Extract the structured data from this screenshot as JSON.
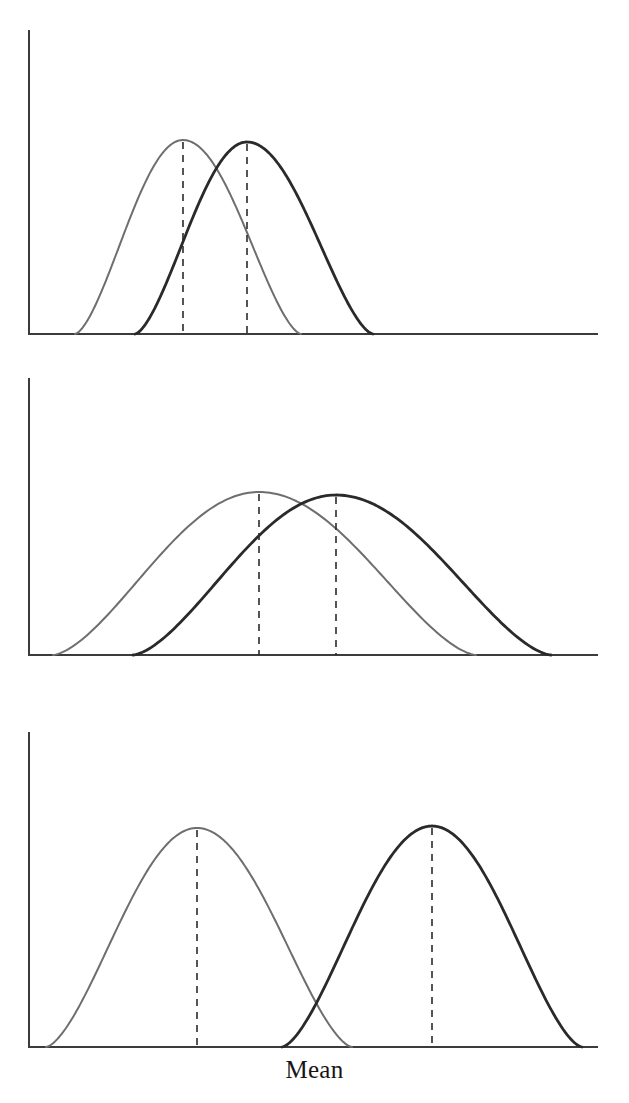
{
  "figure": {
    "width": 629,
    "height": 1103,
    "background": "#ffffff",
    "x_axis_caption": "Mean",
    "caption_y": 1057,
    "caption_font_size": 25
  },
  "style": {
    "axis_color": "#3b3b3b",
    "axis_width": 2,
    "dash_color": "#2b2b2b",
    "dash_width": 1.6,
    "dash_pattern": "7 6",
    "light_curve_color": "#6e6e6e",
    "light_curve_width": 2.0,
    "dark_curve_color": "#2a2a2a",
    "dark_curve_width": 2.8
  },
  "chart_data": {
    "type": "line",
    "title": "",
    "subtitle": "",
    "xlabel": "Mean",
    "ylabel": "",
    "grid": false,
    "legend": "none",
    "panels": [
      {
        "name": "panel-top",
        "index": 1,
        "plot": {
          "x0": 29,
          "x1": 597,
          "baseline_y": 334,
          "axis_top_y": 31
        },
        "series": [
          {
            "name": "group-light-top",
            "style": "light",
            "mean_x": 183,
            "peak_y": 140,
            "left_x": 75,
            "right_x": 301
          },
          {
            "name": "group-dark-top",
            "style": "dark",
            "mean_x": 247,
            "peak_y": 142,
            "left_x": 135,
            "right_x": 373
          }
        ]
      },
      {
        "name": "panel-middle",
        "index": 2,
        "plot": {
          "x0": 29,
          "x1": 597,
          "baseline_y": 655,
          "axis_top_y": 379
        },
        "series": [
          {
            "name": "group-light-middle",
            "style": "light",
            "mean_x": 259,
            "peak_y": 492,
            "left_x": 53,
            "right_x": 476
          },
          {
            "name": "group-dark-middle",
            "style": "dark",
            "mean_x": 336,
            "peak_y": 495,
            "left_x": 133,
            "right_x": 551
          }
        ]
      },
      {
        "name": "panel-bottom",
        "index": 3,
        "plot": {
          "x0": 29,
          "x1": 597,
          "baseline_y": 1047,
          "axis_top_y": 733
        },
        "series": [
          {
            "name": "group-light-bottom",
            "style": "light",
            "mean_x": 197,
            "peak_y": 828,
            "left_x": 46,
            "right_x": 352
          },
          {
            "name": "group-dark-bottom",
            "style": "dark",
            "mean_x": 432,
            "peak_y": 826,
            "left_x": 282,
            "right_x": 582
          }
        ]
      }
    ]
  }
}
